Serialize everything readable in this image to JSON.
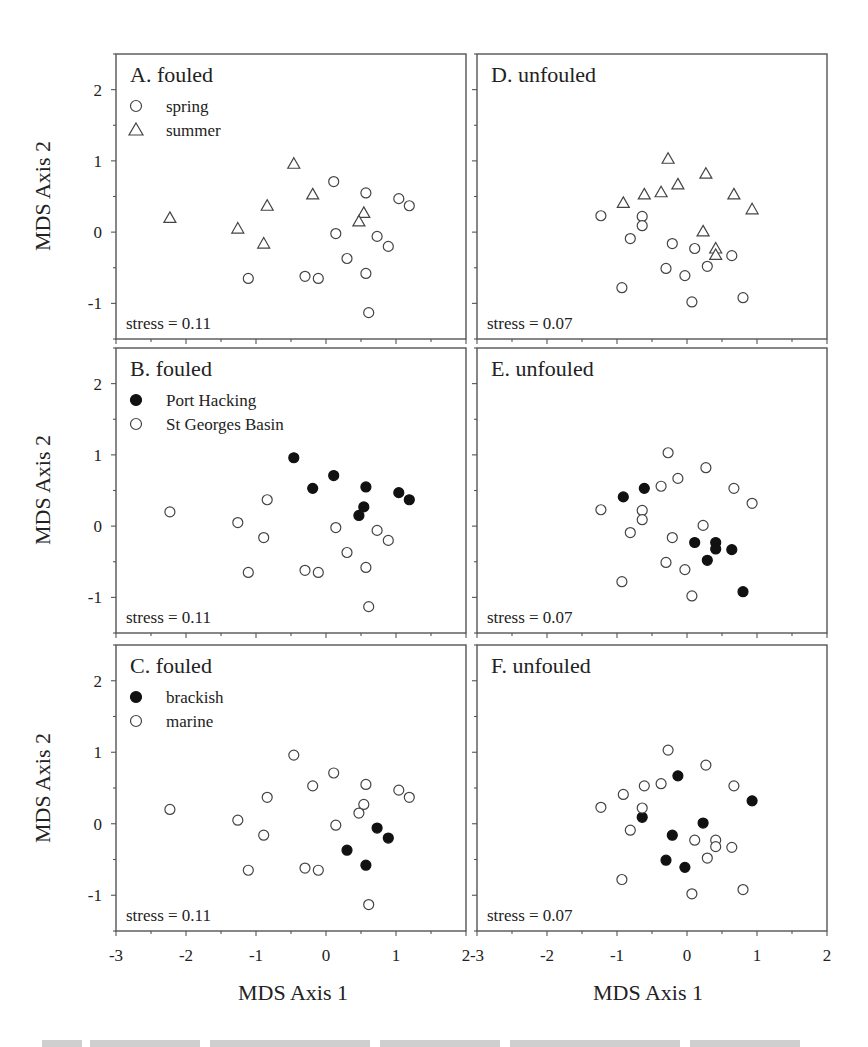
{
  "figure": {
    "y_axis_title": "MDS Axis 2",
    "x_axis_title": "MDS Axis 1",
    "x_ticks": [
      "-3",
      "-2",
      "-1",
      "0",
      "1",
      "2"
    ],
    "y_ticks": [
      "-1",
      "0",
      "1",
      "2"
    ],
    "caption_visible": "cropped, illegible caption line"
  },
  "chart_data": [
    {
      "type": "scatter",
      "panel": "A",
      "title": "A. fouled",
      "stress": "stress = 0.11",
      "xlabel": "MDS Axis 1",
      "ylabel": "MDS Axis 2",
      "xlim": [
        -3,
        2
      ],
      "ylim": [
        -1.5,
        2.5
      ],
      "grid": false,
      "legend_position": "upper-left",
      "series": [
        {
          "name": "spring",
          "marker": "circle-open",
          "points": [
            [
              0.11,
              0.71
            ],
            [
              0.57,
              0.55
            ],
            [
              1.04,
              0.47
            ],
            [
              1.19,
              0.37
            ],
            [
              0.14,
              -0.02
            ],
            [
              0.73,
              -0.06
            ],
            [
              0.89,
              -0.2
            ],
            [
              0.3,
              -0.37
            ],
            [
              0.57,
              -0.58
            ],
            [
              -1.11,
              -0.65
            ],
            [
              -0.3,
              -0.62
            ],
            [
              -0.11,
              -0.65
            ],
            [
              0.61,
              -1.13
            ]
          ]
        },
        {
          "name": "summer",
          "marker": "triangle-open",
          "points": [
            [
              -2.23,
              0.2
            ],
            [
              -1.26,
              0.05
            ],
            [
              -0.84,
              0.37
            ],
            [
              -0.89,
              -0.16
            ],
            [
              -0.46,
              0.96
            ],
            [
              -0.19,
              0.53
            ],
            [
              0.54,
              0.27
            ],
            [
              0.47,
              0.15
            ]
          ]
        }
      ]
    },
    {
      "type": "scatter",
      "panel": "B",
      "title": "B. fouled",
      "stress": "stress = 0.11",
      "xlabel": "MDS Axis 1",
      "ylabel": "MDS Axis 2",
      "xlim": [
        -3,
        2
      ],
      "ylim": [
        -1.5,
        2.5
      ],
      "grid": false,
      "legend_position": "upper-left",
      "series": [
        {
          "name": "Port Hacking",
          "marker": "circle-filled",
          "points": [
            [
              -0.46,
              0.96
            ],
            [
              0.11,
              0.71
            ],
            [
              -0.19,
              0.53
            ],
            [
              0.57,
              0.55
            ],
            [
              1.04,
              0.47
            ],
            [
              1.19,
              0.37
            ],
            [
              0.54,
              0.27
            ],
            [
              0.47,
              0.15
            ]
          ]
        },
        {
          "name": "St Georges Basin",
          "marker": "circle-open",
          "points": [
            [
              -2.23,
              0.2
            ],
            [
              -1.26,
              0.05
            ],
            [
              -0.84,
              0.37
            ],
            [
              -0.89,
              -0.16
            ],
            [
              0.14,
              -0.02
            ],
            [
              0.73,
              -0.06
            ],
            [
              0.89,
              -0.2
            ],
            [
              0.3,
              -0.37
            ],
            [
              0.57,
              -0.58
            ],
            [
              -1.11,
              -0.65
            ],
            [
              -0.3,
              -0.62
            ],
            [
              -0.11,
              -0.65
            ],
            [
              0.61,
              -1.13
            ]
          ]
        }
      ]
    },
    {
      "type": "scatter",
      "panel": "C",
      "title": "C. fouled",
      "stress": "stress = 0.11",
      "xlabel": "MDS Axis 1",
      "ylabel": "MDS Axis 2",
      "xlim": [
        -3,
        2
      ],
      "ylim": [
        -1.5,
        2.5
      ],
      "grid": false,
      "legend_position": "upper-left",
      "series": [
        {
          "name": "brackish",
          "marker": "circle-filled",
          "points": [
            [
              0.73,
              -0.06
            ],
            [
              0.89,
              -0.2
            ],
            [
              0.3,
              -0.37
            ],
            [
              0.57,
              -0.58
            ]
          ]
        },
        {
          "name": "marine",
          "marker": "circle-open",
          "points": [
            [
              -2.23,
              0.2
            ],
            [
              -1.26,
              0.05
            ],
            [
              -0.84,
              0.37
            ],
            [
              -0.89,
              -0.16
            ],
            [
              -0.46,
              0.96
            ],
            [
              -0.19,
              0.53
            ],
            [
              0.54,
              0.27
            ],
            [
              0.47,
              0.15
            ],
            [
              0.11,
              0.71
            ],
            [
              0.57,
              0.55
            ],
            [
              1.04,
              0.47
            ],
            [
              1.19,
              0.37
            ],
            [
              0.14,
              -0.02
            ],
            [
              -1.11,
              -0.65
            ],
            [
              -0.3,
              -0.62
            ],
            [
              -0.11,
              -0.65
            ],
            [
              0.61,
              -1.13
            ]
          ]
        }
      ]
    },
    {
      "type": "scatter",
      "panel": "D",
      "title": "D. unfouled",
      "stress": "stress = 0.07",
      "xlabel": "MDS Axis 1",
      "ylabel": "",
      "xlim": [
        -3,
        2
      ],
      "ylim": [
        -1.5,
        2.5
      ],
      "grid": false,
      "series": [
        {
          "name": "spring",
          "marker": "circle-open",
          "points": [
            [
              -1.23,
              0.23
            ],
            [
              -0.64,
              0.22
            ],
            [
              -0.64,
              0.09
            ],
            [
              -0.81,
              -0.09
            ],
            [
              -0.21,
              -0.16
            ],
            [
              0.11,
              -0.23
            ],
            [
              0.64,
              -0.33
            ],
            [
              0.29,
              -0.48
            ],
            [
              -0.3,
              -0.51
            ],
            [
              -0.03,
              -0.61
            ],
            [
              -0.93,
              -0.78
            ],
            [
              0.8,
              -0.92
            ],
            [
              0.07,
              -0.98
            ]
          ]
        },
        {
          "name": "summer",
          "marker": "triangle-open",
          "points": [
            [
              -0.27,
              1.03
            ],
            [
              0.27,
              0.82
            ],
            [
              -0.13,
              0.67
            ],
            [
              -0.37,
              0.56
            ],
            [
              -0.61,
              0.53
            ],
            [
              -0.91,
              0.41
            ],
            [
              0.67,
              0.53
            ],
            [
              0.93,
              0.32
            ],
            [
              0.23,
              0.01
            ],
            [
              0.41,
              -0.23
            ],
            [
              0.41,
              -0.32
            ]
          ]
        }
      ]
    },
    {
      "type": "scatter",
      "panel": "E",
      "title": "E. unfouled",
      "stress": "stress = 0.07",
      "xlabel": "MDS Axis 1",
      "ylabel": "",
      "xlim": [
        -3,
        2
      ],
      "ylim": [
        -1.5,
        2.5
      ],
      "grid": false,
      "series": [
        {
          "name": "Port Hacking",
          "marker": "circle-filled",
          "points": [
            [
              -0.91,
              0.41
            ],
            [
              -0.61,
              0.53
            ],
            [
              0.11,
              -0.23
            ],
            [
              0.41,
              -0.23
            ],
            [
              0.41,
              -0.32
            ],
            [
              0.64,
              -0.33
            ],
            [
              0.29,
              -0.48
            ],
            [
              0.8,
              -0.92
            ]
          ]
        },
        {
          "name": "St Georges Basin",
          "marker": "circle-open",
          "points": [
            [
              -0.27,
              1.03
            ],
            [
              0.27,
              0.82
            ],
            [
              -0.13,
              0.67
            ],
            [
              -0.37,
              0.56
            ],
            [
              0.67,
              0.53
            ],
            [
              0.93,
              0.32
            ],
            [
              0.23,
              0.01
            ],
            [
              -1.23,
              0.23
            ],
            [
              -0.64,
              0.22
            ],
            [
              -0.64,
              0.09
            ],
            [
              -0.81,
              -0.09
            ],
            [
              -0.21,
              -0.16
            ],
            [
              -0.3,
              -0.51
            ],
            [
              -0.03,
              -0.61
            ],
            [
              -0.93,
              -0.78
            ],
            [
              0.07,
              -0.98
            ]
          ]
        }
      ]
    },
    {
      "type": "scatter",
      "panel": "F",
      "title": "F. unfouled",
      "stress": "stress = 0.07",
      "xlabel": "MDS Axis 1",
      "ylabel": "",
      "xlim": [
        -3,
        2
      ],
      "ylim": [
        -1.5,
        2.5
      ],
      "grid": false,
      "series": [
        {
          "name": "brackish",
          "marker": "circle-filled",
          "points": [
            [
              -0.13,
              0.67
            ],
            [
              0.93,
              0.32
            ],
            [
              -0.64,
              0.09
            ],
            [
              0.23,
              0.01
            ],
            [
              -0.21,
              -0.16
            ],
            [
              -0.3,
              -0.51
            ],
            [
              -0.03,
              -0.61
            ]
          ]
        },
        {
          "name": "marine",
          "marker": "circle-open",
          "points": [
            [
              -0.27,
              1.03
            ],
            [
              0.27,
              0.82
            ],
            [
              -0.37,
              0.56
            ],
            [
              -0.61,
              0.53
            ],
            [
              -0.91,
              0.41
            ],
            [
              0.67,
              0.53
            ],
            [
              -1.23,
              0.23
            ],
            [
              -0.64,
              0.22
            ],
            [
              -0.81,
              -0.09
            ],
            [
              0.11,
              -0.23
            ],
            [
              0.41,
              -0.23
            ],
            [
              0.41,
              -0.32
            ],
            [
              0.64,
              -0.33
            ],
            [
              0.29,
              -0.48
            ],
            [
              -0.93,
              -0.78
            ],
            [
              0.8,
              -0.92
            ],
            [
              0.07,
              -0.98
            ]
          ]
        }
      ]
    }
  ]
}
